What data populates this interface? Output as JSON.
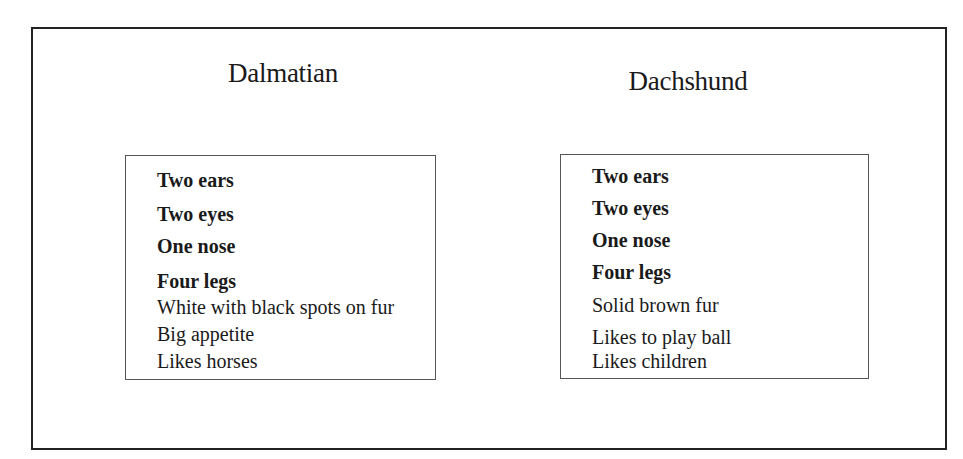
{
  "diagram": {
    "type": "comparison",
    "columns": [
      {
        "title": "Dalmatian",
        "items": [
          {
            "text": "Two ears",
            "shared": true
          },
          {
            "text": "Two eyes",
            "shared": true
          },
          {
            "text": "One nose",
            "shared": true
          },
          {
            "text": "Four legs",
            "shared": true
          },
          {
            "text": "White with black spots on fur",
            "shared": false
          },
          {
            "text": "Big appetite",
            "shared": false
          },
          {
            "text": "Likes horses",
            "shared": false
          }
        ]
      },
      {
        "title": "Dachshund",
        "items": [
          {
            "text": "Two ears",
            "shared": true
          },
          {
            "text": "Two eyes",
            "shared": true
          },
          {
            "text": "One nose",
            "shared": true
          },
          {
            "text": "Four legs",
            "shared": true
          },
          {
            "text": "Solid brown fur",
            "shared": false
          },
          {
            "text": "Likes to play ball",
            "shared": false
          },
          {
            "text": "Likes children",
            "shared": false
          }
        ]
      }
    ]
  }
}
